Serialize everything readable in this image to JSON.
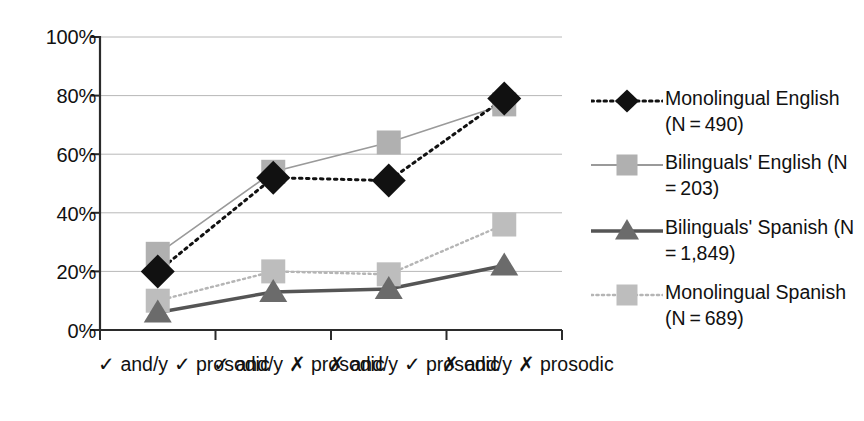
{
  "chart_data": {
    "type": "line",
    "title": "",
    "xlabel": "",
    "ylabel": "",
    "ylim": [
      0,
      100
    ],
    "yticks": [
      "0%",
      "20%",
      "40%",
      "60%",
      "80%",
      "100%"
    ],
    "ytick_values": [
      0,
      20,
      40,
      60,
      80,
      100
    ],
    "grid": true,
    "legend_position": "right",
    "categories": [
      "✓ and/y\n✓ prosodic",
      "✓ and/y\n✗ prosodic",
      "✗ and/y\n✓ prosodic",
      "✗ and/y\n✗ prosodic"
    ],
    "series": [
      {
        "name": "Monolingual English (N = 490)",
        "label_line1": "Monolingual",
        "label_line2": "English (N = 490)",
        "values": [
          20,
          52,
          51,
          79
        ],
        "marker": "diamond",
        "color": "#111111",
        "line_style": "dotted",
        "line_width": 3
      },
      {
        "name": "Bilinguals' English (N = 203)",
        "label_line1": "Bilinguals'",
        "label_line2": "English (N = 203)",
        "values": [
          26,
          54,
          64,
          77
        ],
        "marker": "square",
        "color": "#b0b0b0",
        "line_color": "#9a9a9a",
        "line_style": "solid",
        "line_width": 1.6
      },
      {
        "name": "Bilinguals' Spanish (N = 1,849)",
        "label_line1": "Bilinguals'",
        "label_line2": "Spanish (N = 1,849)",
        "values": [
          6,
          13,
          14,
          22
        ],
        "marker": "triangle",
        "color": "#6b6b6b",
        "line_color": "#555555",
        "line_style": "solid",
        "line_width": 3.5
      },
      {
        "name": "Monolingual Spanish (N = 689)",
        "label_line1": "Monolingual",
        "label_line2": "Spanish (N = 689)",
        "values": [
          10,
          20,
          19,
          36
        ],
        "marker": "square",
        "color": "#bdbdbd",
        "line_color": "#b5b5b5",
        "line_style": "dotted",
        "line_width": 2.4
      }
    ]
  }
}
